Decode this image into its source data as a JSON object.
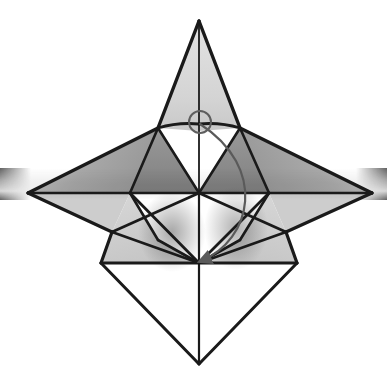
{
  "canvas": {
    "width": 387,
    "height": 379,
    "background": "#ffffff",
    "title": "Origami crease pattern fold step"
  },
  "palette": {
    "stroke": "#1a1a1a",
    "stroke_thin": "#2b2b2b",
    "paper_light": "#d9d9d9",
    "paper_mid": "#bfbfbf",
    "paper_dark": "#8c8c8c",
    "shadow_band": "#4f4f4f",
    "white_face": "#ffffff",
    "arrow": "#5a5a5a",
    "marker_circle": "#5e5e5e"
  },
  "geometry": {
    "apex_top": {
      "x": 199,
      "y": 21
    },
    "apex_bottom": {
      "x": 199,
      "y": 364
    },
    "apex_left": {
      "x": 28,
      "y": 193
    },
    "apex_right": {
      "x": 372,
      "y": 193
    },
    "center": {
      "x": 199,
      "y": 193
    },
    "node_left_mid": {
      "x": 130,
      "y": 193
    },
    "node_right_mid": {
      "x": 269,
      "y": 193
    },
    "node_top_left": {
      "x": 158,
      "y": 128
    },
    "node_top_right": {
      "x": 240,
      "y": 128
    },
    "node_bottom_left": {
      "x": 101,
      "y": 263
    },
    "node_bottom_right": {
      "x": 297,
      "y": 263
    },
    "node_inner_left": {
      "x": 112,
      "y": 232
    },
    "node_inner_right": {
      "x": 286,
      "y": 232
    },
    "node_wing_left_upper": {
      "x": 108,
      "y": 160
    },
    "node_wing_right_upper": {
      "x": 290,
      "y": 160
    }
  },
  "elements": {
    "top_spike_label": "top-point",
    "bottom_spike_label": "bottom-point",
    "left_wing_label": "left-point",
    "right_wing_label": "right-point",
    "center_node_label": "center-vertex",
    "shadow_band_label": "horizontal-shadow-band",
    "marker_circle_label": "rotation-marker",
    "fold_arrow_label": "fold-arrow"
  },
  "markers": {
    "circle": {
      "cx": 200,
      "cy": 122,
      "r": 11,
      "stroke_width": 2
    },
    "arrow": {
      "start": {
        "x": 200,
        "y": 124
      },
      "control_1": {
        "x": 268,
        "y": 168
      },
      "control_2": {
        "x": 252,
        "y": 240
      },
      "end": {
        "x": 201,
        "y": 261
      },
      "head_angle_deg": 255
    }
  },
  "chart_data": {
    "type": "diagram",
    "title": "Origami crease pattern fold step"
  }
}
